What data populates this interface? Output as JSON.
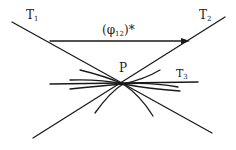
{
  "diagram": {
    "labels": {
      "t1": {
        "main": "T",
        "sub": "1"
      },
      "t2": {
        "main": "T",
        "sub": "2"
      },
      "t3": {
        "main": "T",
        "sub": "3"
      },
      "p": "P",
      "arrow": {
        "main": "(φ",
        "sub": "12",
        "tail": ")*"
      }
    },
    "colors": {
      "stroke": "#1a1a1a",
      "background": "#ffffff"
    },
    "lines": [
      {
        "id": "T1",
        "from": [
          12,
          22
        ],
        "to": [
          212,
          133
        ]
      },
      {
        "id": "T2",
        "from": [
          225,
          17
        ],
        "to": [
          33,
          138
        ]
      },
      {
        "id": "T3",
        "from": [
          50,
          84
        ],
        "to": [
          198,
          82
        ]
      },
      {
        "id": "phi12-arrow",
        "from": [
          50,
          41
        ],
        "to": [
          190,
          41
        ]
      }
    ],
    "point": {
      "id": "P",
      "at": [
        123,
        84
      ]
    }
  }
}
